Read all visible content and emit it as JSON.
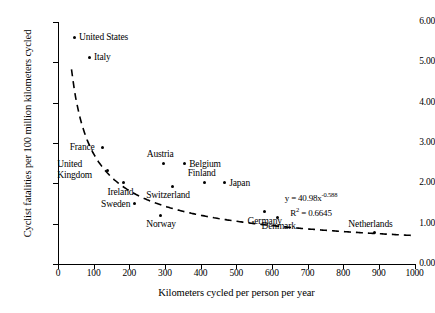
{
  "chart_data": {
    "type": "scatter",
    "title": "",
    "xlabel": "Kilometers cycled per person per year",
    "ylabel": "Cyclist fatalities per 100 million kilometers cycled",
    "xlim": [
      0,
      1000
    ],
    "ylim": [
      0,
      6
    ],
    "xticks": [
      "0",
      "100",
      "200",
      "300",
      "400",
      "500",
      "600",
      "700",
      "800",
      "900",
      "1000"
    ],
    "yticks": [
      "0.00",
      "1.00",
      "2.00",
      "3.00",
      "4.00",
      "5.00",
      "6.00"
    ],
    "grid": false,
    "legend": "none",
    "points": [
      {
        "label": "United States",
        "x": 45,
        "y": 5.62,
        "label_pos": "right"
      },
      {
        "label": "Italy",
        "x": 87,
        "y": 5.13,
        "label_pos": "right"
      },
      {
        "label": "France",
        "x": 126,
        "y": 2.9,
        "label_pos": "left"
      },
      {
        "label": "United Kingdom",
        "x": 138,
        "y": 2.33,
        "label_pos": "left-two-line"
      },
      {
        "label": "Austria",
        "x": 295,
        "y": 2.5,
        "label_pos": "above"
      },
      {
        "label": "Belgium",
        "x": 354,
        "y": 2.48,
        "label_pos": "right"
      },
      {
        "label": "Ireland",
        "x": 185,
        "y": 2.01,
        "label_pos": "below"
      },
      {
        "label": "Switzerland",
        "x": 320,
        "y": 1.93,
        "label_pos": "below"
      },
      {
        "label": "Finland",
        "x": 410,
        "y": 2.03,
        "label_pos": "above"
      },
      {
        "label": "Japan",
        "x": 466,
        "y": 2.01,
        "label_pos": "right"
      },
      {
        "label": "Sweden",
        "x": 214,
        "y": 1.49,
        "label_pos": "left"
      },
      {
        "label": "Norway",
        "x": 287,
        "y": 1.21,
        "label_pos": "below"
      },
      {
        "label": "Germany",
        "x": 578,
        "y": 1.29,
        "label_pos": "below"
      },
      {
        "label": "Denmark",
        "x": 617,
        "y": 1.16,
        "label_pos": "below"
      },
      {
        "label": "Netherlands",
        "x": 887,
        "y": 0.77,
        "label_pos": "above"
      }
    ],
    "trendline": {
      "style": "dashed",
      "type": "power",
      "coefficient": 40.98,
      "exponent": -0.588,
      "r_squared": 0.6645,
      "equation_text": "y = 40.98x",
      "equation_exponent": "-0.588",
      "r2_text": "R",
      "r2_superscript": "2",
      "r2_value": "= 0.6645"
    }
  }
}
